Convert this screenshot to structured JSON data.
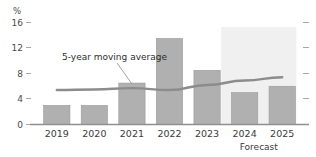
{
  "chart_data": {
    "type": "bar",
    "title": "",
    "subtitle": "",
    "xlabel": "",
    "ylabel": "%",
    "categories": [
      "2019",
      "2020",
      "2021",
      "2022",
      "2023",
      "2024",
      "2025"
    ],
    "values": [
      3.0,
      3.0,
      6.5,
      13.5,
      8.5,
      5.0,
      6.0
    ],
    "series": [
      {
        "name": "Annual value",
        "type": "bar",
        "values": [
          3.0,
          3.0,
          6.5,
          13.5,
          8.5,
          5.0,
          6.0
        ]
      },
      {
        "name": "5-year moving average",
        "type": "line",
        "values": [
          5.4,
          5.5,
          5.7,
          5.4,
          6.2,
          6.9,
          7.4
        ]
      }
    ],
    "ylim": [
      0,
      16
    ],
    "yticks": [
      0,
      4,
      8,
      12,
      16
    ],
    "ytick_labels": [
      "0",
      "4",
      "8",
      "12",
      "16"
    ],
    "grid": false,
    "legend": "none",
    "annotations": [
      {
        "name": "moving-average-annotation",
        "text": "5-year moving average",
        "points_to_category": "2021"
      },
      {
        "name": "forecast-band-label",
        "text": "Forecast",
        "covers_categories": [
          "2024",
          "2025"
        ]
      }
    ],
    "colors": {
      "bar": "#b0b0b0",
      "bar_edge": "#9a9a9a",
      "line": "#8c8c8c",
      "axis": "#909090",
      "forecast_band": "#f0f0f0",
      "text": "#3b3b3b"
    }
  },
  "axis": {
    "unit_label": "%",
    "y_ticks": [
      "16",
      "12",
      "8",
      "4",
      "0"
    ]
  },
  "categories": {
    "c0": "2019",
    "c1": "2020",
    "c2": "2021",
    "c3": "2022",
    "c4": "2023",
    "c5": "2024",
    "c6": "2025"
  },
  "labels": {
    "moving_average": "5-year moving average",
    "forecast": "Forecast"
  }
}
